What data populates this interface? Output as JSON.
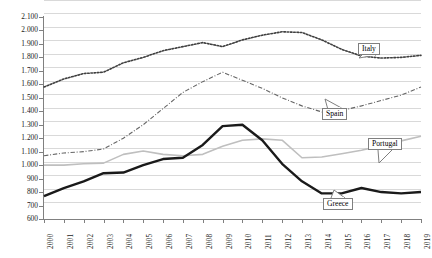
{
  "chart_data": {
    "type": "line",
    "title": "",
    "subtitle": "",
    "xlabel": "",
    "ylabel": "",
    "grid": true,
    "legend_position": "inline-callouts",
    "categories": [
      "2000",
      "2001",
      "2002",
      "2003",
      "2004",
      "2005",
      "2006",
      "2007",
      "2008",
      "2009",
      "2010",
      "2011",
      "2012",
      "2013",
      "2014",
      "2015",
      "2016",
      "2017",
      "2018",
      "2019"
    ],
    "x": [
      2000,
      2001,
      2002,
      2003,
      2004,
      2005,
      2006,
      2007,
      2008,
      2009,
      2010,
      2011,
      2012,
      2013,
      2014,
      2015,
      2016,
      2017,
      2018,
      2019
    ],
    "ylim": [
      600,
      2100
    ],
    "ytick_values": [
      600,
      700,
      800,
      900,
      1000,
      1100,
      1200,
      1300,
      1400,
      1500,
      1600,
      1700,
      1800,
      1900,
      2000,
      2100
    ],
    "ytick_labels": [
      "600",
      "700",
      "800",
      "900",
      "1.000",
      "1.100",
      "1.200",
      "1.300",
      "1.400",
      "1.500",
      "1.600",
      "1.700",
      "1.800",
      "1.900",
      "2.000",
      "2.100"
    ],
    "series": [
      {
        "name": "Italy",
        "style": "dotted",
        "color": "#404040",
        "width": 1.6,
        "values": [
          1580,
          1640,
          1680,
          1690,
          1760,
          1800,
          1850,
          1880,
          1910,
          1880,
          1930,
          1965,
          1990,
          1985,
          1930,
          1860,
          1810,
          1795,
          1800,
          1815
        ]
      },
      {
        "name": "Spain",
        "style": "dash-dot",
        "color": "#666666",
        "width": 1.1,
        "values": [
          1070,
          1090,
          1100,
          1120,
          1200,
          1300,
          1420,
          1540,
          1620,
          1690,
          1630,
          1570,
          1500,
          1440,
          1395,
          1405,
          1440,
          1480,
          1520,
          1580
        ]
      },
      {
        "name": "Portugal",
        "style": "solid",
        "color": "#bfbfbf",
        "width": 1.6,
        "values": [
          1000,
          1000,
          1010,
          1015,
          1080,
          1105,
          1080,
          1070,
          1080,
          1140,
          1185,
          1195,
          1185,
          1055,
          1060,
          1085,
          1110,
          1145,
          1180,
          1215
        ]
      },
      {
        "name": "Greece",
        "style": "solid",
        "color": "#1a1a1a",
        "width": 2.4,
        "values": [
          770,
          830,
          880,
          940,
          945,
          1000,
          1045,
          1055,
          1150,
          1290,
          1300,
          1185,
          1010,
          880,
          790,
          790,
          830,
          800,
          790,
          800
        ]
      }
    ],
    "annotations": [
      {
        "label": "Italy",
        "target_year": 2013,
        "box_x": 358,
        "box_y": 43,
        "leader_to_x": 359,
        "leader_to_y": 58
      },
      {
        "label": "Spain",
        "target_year": 2014,
        "box_x": 322,
        "box_y": 108,
        "leader_to_x": 325,
        "leader_to_y": 99
      },
      {
        "label": "Portugal",
        "target_year": 2017,
        "box_x": 368,
        "box_y": 138,
        "leader_to_x": 379,
        "leader_to_y": 163
      },
      {
        "label": "Greece",
        "target_year": 2016,
        "box_x": 323,
        "box_y": 198,
        "leader_to_x": 334,
        "leader_to_y": 190
      }
    ]
  }
}
